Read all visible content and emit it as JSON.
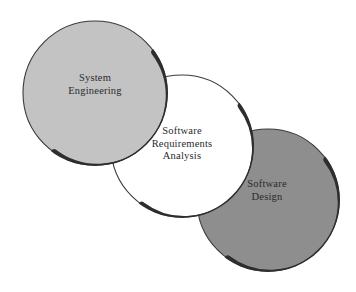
{
  "diagram": {
    "type": "venn",
    "background_color": "#ffffff",
    "outline_color": "#3a3a3a",
    "shadow_color": "#2e2e2e",
    "text_color": "#2b2b2b",
    "circles": [
      {
        "id": "system-engineering",
        "label_lines": [
          "System",
          "Engineering"
        ],
        "line1": "System",
        "line2": "Engineering",
        "fill_color": "#c3c3c3",
        "center_x": 95,
        "center_y": 93,
        "radius": 72,
        "z_order": 3
      },
      {
        "id": "software-requirements-analysis",
        "label_lines": [
          "Software",
          "Requirements",
          "Analysis"
        ],
        "line1": "Software",
        "line2": "Requirements",
        "line3": "Analysis",
        "fill_color": "#ffffff",
        "center_x": 182,
        "center_y": 146,
        "radius": 71,
        "z_order": 2
      },
      {
        "id": "software-design",
        "label_lines": [
          "Software",
          "Design"
        ],
        "line1": "Software",
        "line2": "Design",
        "fill_color": "#8e8e8e",
        "center_x": 268,
        "center_y": 200,
        "radius": 71,
        "z_order": 1
      }
    ]
  }
}
